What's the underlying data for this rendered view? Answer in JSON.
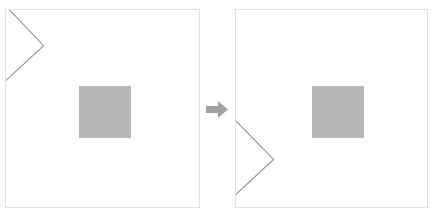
{
  "figure": {
    "type": "before-after-transform",
    "background_color": "#ffffff",
    "panel_border_color": "#e2e2e2",
    "shape_fill_color": "#b6b6b6",
    "outline_stroke_color": "#8c8c8c",
    "arrow_color": "#a0a0a0"
  },
  "panels": [
    {
      "id": "before",
      "role": "before",
      "label": "",
      "shapes": [
        {
          "name": "chevron-outline",
          "kind": "polyline",
          "points": "0,-5 38,36 0,73",
          "position": "upper-left",
          "stroke": "#8c8c8c",
          "stroke_width": 1
        },
        {
          "name": "filled-square",
          "kind": "square",
          "fill": "#b6b6b6",
          "size_px": 52,
          "x_px": 73,
          "y_px": 76
        }
      ]
    },
    {
      "id": "after",
      "role": "after",
      "label": "",
      "shapes": [
        {
          "name": "chevron-outline",
          "kind": "polyline",
          "points": "0,111 38,151 0,187",
          "position": "lower-left",
          "stroke": "#8c8c8c",
          "stroke_width": 1
        },
        {
          "name": "filled-square",
          "kind": "square",
          "fill": "#b6b6b6",
          "size_px": 52,
          "x_px": 76,
          "y_px": 76
        }
      ]
    }
  ],
  "arrow": {
    "name": "transform-arrow",
    "direction": "right",
    "color": "#a0a0a0",
    "label": ""
  }
}
